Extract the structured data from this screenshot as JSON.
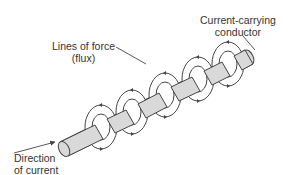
{
  "diagram": {
    "labels": {
      "conductor_line1": "Current-carrying",
      "conductor_line2": "conductor",
      "flux_line1": "Lines of force",
      "flux_line2": "(flux)",
      "direction_line1": "Direction",
      "direction_line2": "of current"
    },
    "colors": {
      "conductor_fill": "#d9d9d9",
      "stroke": "#444444",
      "ring_fill": "#ffffff"
    },
    "ring_count": 5
  }
}
